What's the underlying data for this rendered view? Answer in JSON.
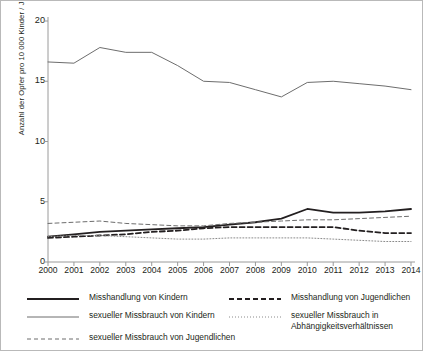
{
  "chart_data": {
    "type": "line",
    "title": "",
    "xlabel": "",
    "ylabel": "Anzahl der Opfer pro 10 000 Kinder / Jugendliche",
    "categories": [
      "2000",
      "2001",
      "2002",
      "2003",
      "2004",
      "2005",
      "2006",
      "2007",
      "2008",
      "2009",
      "2010",
      "2011",
      "2012",
      "2013",
      "2014"
    ],
    "xlim": [
      2000,
      2014
    ],
    "ylim": [
      0,
      20
    ],
    "yticks": [
      0,
      5,
      10,
      15,
      20
    ],
    "grid": false,
    "legend_position": "bottom",
    "series": [
      {
        "name": "Misshandlung von Kindern",
        "style": "solid-thick",
        "color": "#231f20",
        "values": [
          2.1,
          2.3,
          2.5,
          2.6,
          2.7,
          2.8,
          2.9,
          3.1,
          3.3,
          3.6,
          4.4,
          4.1,
          4.1,
          4.2,
          4.4
        ]
      },
      {
        "name": "Misshandlung von Jugendlichen",
        "style": "dashed-thick",
        "color": "#231f20",
        "values": [
          2.0,
          2.1,
          2.2,
          2.3,
          2.5,
          2.6,
          2.8,
          2.9,
          2.9,
          2.9,
          2.9,
          2.9,
          2.6,
          2.4,
          2.4
        ]
      },
      {
        "name": "sexueller Missbrauch von Kindern",
        "style": "solid-thin",
        "color": "#6d6d6d",
        "values": [
          16.6,
          16.5,
          17.8,
          17.4,
          17.4,
          16.3,
          15.0,
          14.9,
          14.3,
          13.7,
          14.9,
          15.0,
          14.8,
          14.6,
          14.3
        ]
      },
      {
        "name": "sexueller Missbrauch von Jugendlichen",
        "style": "dashed-thin",
        "color": "#6d6d6d",
        "values": [
          3.2,
          3.3,
          3.4,
          3.2,
          3.1,
          3.0,
          3.0,
          3.2,
          3.3,
          3.4,
          3.5,
          3.5,
          3.6,
          3.7,
          3.8
        ]
      },
      {
        "name": "sexueller Missbrauch in Abhängigkeitsverhältnissen",
        "style": "dotted",
        "color": "#8a8a8a",
        "values": [
          2.1,
          2.2,
          2.2,
          2.1,
          2.0,
          1.9,
          1.9,
          2.0,
          2.0,
          2.0,
          2.0,
          1.9,
          1.8,
          1.7,
          1.7
        ]
      }
    ]
  },
  "legend": {
    "items": [
      {
        "label": "Misshandlung von Kindern",
        "style": "solid-thick",
        "col": 0,
        "row": 0
      },
      {
        "label": "Misshandlung von Jugendlichen",
        "style": "dashed-thick",
        "col": 1,
        "row": 0
      },
      {
        "label": "sexueller Missbrauch von Kindern",
        "style": "solid-thin",
        "col": 0,
        "row": 1
      },
      {
        "label": "sexueller Missbrauch in\nAbhängigkeitsverhältnissen",
        "style": "dotted",
        "col": 1,
        "row": 1
      },
      {
        "label": "sexueller Missbrauch von Jugendlichen",
        "style": "dashed-thin",
        "col": 0,
        "row": 2
      }
    ]
  }
}
